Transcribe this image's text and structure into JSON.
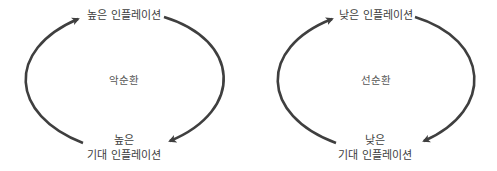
{
  "diagrams": [
    {
      "name": "vicious-cycle",
      "top_label": "높은 인플레이션",
      "center_label": "악순환",
      "bottom_label_line1": "높은",
      "bottom_label_line2": "기대 인플레이션"
    },
    {
      "name": "virtuous-cycle",
      "top_label": "낮은 인플레이션",
      "center_label": "선순환",
      "bottom_label_line1": "낮은",
      "bottom_label_line2": "기대 인플레이션"
    }
  ],
  "colors": {
    "arrow": "#3f3f3f",
    "text": "#3d3d3d",
    "background": "#ffffff"
  }
}
